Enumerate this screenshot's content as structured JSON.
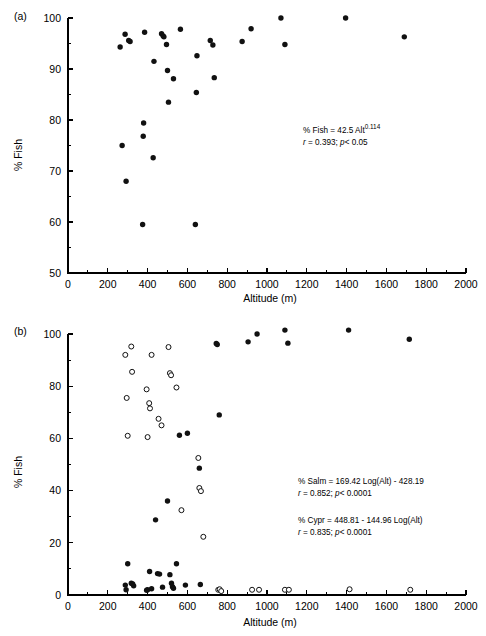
{
  "figure": {
    "panel_a_label": "(a)",
    "panel_b_label": "(b)"
  },
  "chart_data": [
    {
      "type": "scatter",
      "panel": "(a)",
      "title": "",
      "xlabel": "Altitude (m)",
      "ylabel": "% Fish",
      "xlim": [
        0,
        2000
      ],
      "ylim": [
        50,
        100
      ],
      "xticks": [
        0,
        200,
        400,
        600,
        800,
        1000,
        1200,
        1400,
        1600,
        1800,
        2000
      ],
      "yticks": [
        50,
        60,
        70,
        80,
        90,
        100
      ],
      "x_minor_step": 100,
      "y_minor_step": 5,
      "grid": false,
      "legend": "none",
      "annotations": [
        {
          "line_main_pre": "% Fish = 42.5 Alt",
          "line_main_sup": "0.114",
          "line_stats_r_symbol": "r",
          "line_stats_rest": " = 0.393; ",
          "line_stats_p_symbol": "p",
          "line_stats_tail": "< 0.05"
        }
      ],
      "series": [
        {
          "name": "% Fish",
          "marker": "filled-circle",
          "points": [
            [
              262,
              94.3
            ],
            [
              272,
              75.0
            ],
            [
              287,
              96.8
            ],
            [
              292,
              68.0
            ],
            [
              305,
              95.6
            ],
            [
              312,
              95.4
            ],
            [
              375,
              59.5
            ],
            [
              378,
              76.8
            ],
            [
              380,
              79.4
            ],
            [
              385,
              97.2
            ],
            [
              428,
              72.6
            ],
            [
              432,
              91.5
            ],
            [
              470,
              96.9
            ],
            [
              478,
              96.5
            ],
            [
              482,
              96.3
            ],
            [
              495,
              94.8
            ],
            [
              500,
              89.7
            ],
            [
              505,
              83.5
            ],
            [
              530,
              88.1
            ],
            [
              565,
              97.8
            ],
            [
              640,
              59.5
            ],
            [
              645,
              85.4
            ],
            [
              648,
              92.6
            ],
            [
              715,
              95.6
            ],
            [
              728,
              94.7
            ],
            [
              735,
              88.3
            ],
            [
              875,
              95.4
            ],
            [
              920,
              97.9
            ],
            [
              1070,
              100.0
            ],
            [
              1090,
              94.8
            ],
            [
              1395,
              100.0
            ],
            [
              1690,
              96.3
            ]
          ]
        }
      ]
    },
    {
      "type": "scatter",
      "panel": "(b)",
      "title": "",
      "xlabel": "Altitude (m)",
      "ylabel": "% Fish",
      "xlim": [
        0,
        2000
      ],
      "ylim": [
        0,
        100
      ],
      "xticks": [
        0,
        200,
        400,
        600,
        800,
        1000,
        1200,
        1400,
        1600,
        1800,
        2000
      ],
      "yticks": [
        0,
        20,
        40,
        60,
        80,
        100
      ],
      "x_minor_step": 100,
      "y_minor_step": 10,
      "grid": false,
      "legend": "none",
      "annotations": [
        {
          "line_main": "% Salm = 169.42 Log(Alt) - 428.19",
          "line_stats_r_symbol": "r",
          "line_stats_rest": " = 0.852; ",
          "line_stats_p_symbol": "p",
          "line_stats_tail": "< 0.0001"
        },
        {
          "line_main": "% Cypr = 448.81 - 144.96 Log(Alt)",
          "line_stats_r_symbol": "r",
          "line_stats_rest": " = 0.835; ",
          "line_stats_p_symbol": "p",
          "line_stats_tail": "< 0.0001"
        }
      ],
      "series": [
        {
          "name": "% Salm",
          "marker": "filled-circle",
          "points": [
            [
              288,
              3.8
            ],
            [
              292,
              2.0
            ],
            [
              300,
              12.0
            ],
            [
              318,
              4.5
            ],
            [
              325,
              4.2
            ],
            [
              330,
              3.5
            ],
            [
              395,
              1.8
            ],
            [
              400,
              2.0
            ],
            [
              410,
              9.0
            ],
            [
              420,
              2.4
            ],
            [
              440,
              28.8
            ],
            [
              450,
              8.2
            ],
            [
              460,
              8.0
            ],
            [
              475,
              3.0
            ],
            [
              500,
              36.0
            ],
            [
              512,
              7.8
            ],
            [
              520,
              4.5
            ],
            [
              525,
              3.2
            ],
            [
              530,
              2.6
            ],
            [
              545,
              12.0
            ],
            [
              560,
              61.2
            ],
            [
              590,
              3.8
            ],
            [
              600,
              62.0
            ],
            [
              660,
              48.6
            ],
            [
              665,
              4.0
            ],
            [
              745,
              96.4
            ],
            [
              750,
              96.0
            ],
            [
              760,
              69.0
            ],
            [
              905,
              97.0
            ],
            [
              950,
              100.0
            ],
            [
              1090,
              101.5
            ],
            [
              1105,
              96.5
            ],
            [
              1410,
              101.5
            ],
            [
              1715,
              98.0
            ]
          ]
        },
        {
          "name": "% Cypr",
          "marker": "open-circle",
          "points": [
            [
              288,
              92.0
            ],
            [
              295,
              75.5
            ],
            [
              300,
              61.0
            ],
            [
              318,
              95.2
            ],
            [
              322,
              85.5
            ],
            [
              395,
              78.8
            ],
            [
              400,
              60.5
            ],
            [
              408,
              73.5
            ],
            [
              412,
              71.5
            ],
            [
              420,
              92.0
            ],
            [
              455,
              67.5
            ],
            [
              470,
              65.0
            ],
            [
              505,
              95.0
            ],
            [
              512,
              85.0
            ],
            [
              518,
              84.2
            ],
            [
              545,
              79.5
            ],
            [
              570,
              32.5
            ],
            [
              655,
              52.5
            ],
            [
              660,
              41.0
            ],
            [
              668,
              39.8
            ],
            [
              680,
              22.3
            ],
            [
              755,
              2.0
            ],
            [
              762,
              2.2
            ],
            [
              770,
              1.5
            ],
            [
              925,
              2.0
            ],
            [
              960,
              2.0
            ],
            [
              1090,
              2.0
            ],
            [
              1110,
              2.0
            ],
            [
              1415,
              2.2
            ],
            [
              1720,
              2.0
            ]
          ]
        }
      ]
    }
  ]
}
